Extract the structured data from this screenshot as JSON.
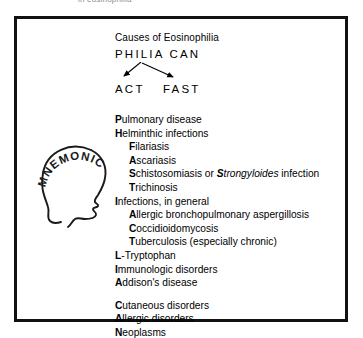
{
  "caption_fragment": "in eosinophilia",
  "figure": {
    "title": "Causes of Eosinophilia",
    "acronym_main": "PHILIA CAN",
    "acronym_branch_left": "ACT",
    "acronym_branch_right": "FAST",
    "mnemonic_label": "MNEMONIC"
  },
  "causes": [
    {
      "key": "P",
      "rest": "ulmonary disease",
      "indent": false,
      "gap_before": false
    },
    {
      "key": "H",
      "rest": "elminthic infections",
      "indent": false,
      "gap_before": false
    },
    {
      "key": "F",
      "rest": "ilariasis",
      "indent": true,
      "gap_before": false
    },
    {
      "key": "A",
      "rest": "scariasis",
      "indent": true,
      "gap_before": false
    },
    {
      "key": "S",
      "rest": "chistosomiasis or ",
      "sci": "S",
      "sci_rest": "trongyloides",
      "tail": " infection",
      "indent": true,
      "gap_before": false
    },
    {
      "key": "T",
      "rest": "richinosis",
      "indent": true,
      "gap_before": false
    },
    {
      "key": "I",
      "rest": "nfections, in general",
      "indent": false,
      "gap_before": false
    },
    {
      "key": "A",
      "rest": "llergic bronchopulmonary aspergillosis",
      "indent": true,
      "gap_before": false
    },
    {
      "key": "C",
      "rest": "occidioidomycosis",
      "indent": true,
      "gap_before": false
    },
    {
      "key": "T",
      "rest": "uberculosis (especially chronic)",
      "indent": true,
      "gap_before": false
    },
    {
      "key": "L",
      "rest": "-Tryptophan",
      "indent": false,
      "gap_before": false
    },
    {
      "key": "I",
      "rest": "mmunologic disorders",
      "indent": false,
      "gap_before": false
    },
    {
      "key": "A",
      "rest": "ddison's disease",
      "indent": false,
      "gap_before": false
    },
    {
      "key": "C",
      "rest": "utaneous disorders",
      "indent": false,
      "gap_before": true
    },
    {
      "key": "A",
      "rest": "llergic disorders",
      "indent": false,
      "gap_before": false
    },
    {
      "key": "N",
      "rest": "eoplasms",
      "indent": false,
      "gap_before": false
    }
  ],
  "colors": {
    "ink": "#000000",
    "frame": "#111111",
    "paper": "#ffffff"
  }
}
